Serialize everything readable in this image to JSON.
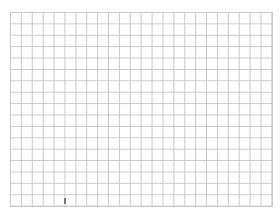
{
  "canvas": {
    "type": "blank grid",
    "columns": 24,
    "rows": 17,
    "grid_color": "#c8c8c8",
    "background_color": "#ffffff"
  },
  "cursor": {
    "icon": "pointer-cursor-icon"
  }
}
